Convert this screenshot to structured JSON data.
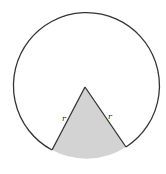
{
  "diagram": {
    "type": "circle-with-shaded-sector",
    "colors": {
      "stroke": "#333333",
      "sector_fill": "#d3d3d3",
      "background": "#ffffff"
    },
    "labels": {
      "left_radius": "r",
      "right_radius": "r"
    }
  }
}
